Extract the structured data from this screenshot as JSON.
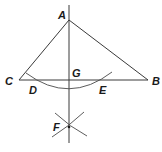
{
  "diagram": {
    "type": "geometric-construction",
    "points": {
      "A": {
        "label": "A",
        "x": 69,
        "y": 20
      },
      "B": {
        "label": "B",
        "x": 148,
        "y": 80
      },
      "C": {
        "label": "C",
        "x": 19,
        "y": 80
      },
      "G": {
        "label": "G",
        "x": 69,
        "y": 80
      },
      "D": {
        "label": "D",
        "x": 30,
        "y": 80
      },
      "E": {
        "label": "E",
        "x": 102,
        "y": 80
      },
      "F": {
        "label": "F",
        "x": 69,
        "y": 127
      }
    },
    "labels": {
      "A": "A",
      "B": "B",
      "C": "C",
      "D": "D",
      "E": "E",
      "F": "F",
      "G": "G"
    },
    "segments": [
      "AC",
      "AB",
      "CB",
      "vertical line through A, G, F"
    ],
    "arcs": [
      "arc centered at A through D and E",
      "arc from D crossing at F",
      "arc from E crossing at F"
    ],
    "colors": {
      "stroke": "#3a3a3a",
      "text": "#1a1a1a",
      "background": "#ffffff"
    }
  }
}
